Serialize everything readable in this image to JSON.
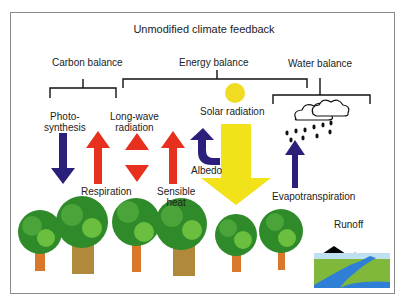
{
  "diagram": {
    "title": "Unmodified climate feedback",
    "groups": {
      "carbon": "Carbon balance",
      "energy": "Energy balance",
      "water": "Water balance"
    },
    "labels": {
      "photosynthesis_1": "Photo-",
      "photosynthesis_2": "synthesis",
      "longwave_1": "Long-wave",
      "longwave_2": "radiation",
      "respiration": "Respiration",
      "sensible_1": "Sensible",
      "sensible_2": "heat",
      "solar": "Solar radiation",
      "albedo": "Albedo",
      "evapotranspiration": "Evapotranspiration",
      "runoff": "Runoff"
    },
    "colors": {
      "blue_arrow": "#2a1f7a",
      "red_arrow": "#e8301e",
      "yellow": "#f2e21a",
      "tree_green": "#2f8a2a",
      "trunk": "#d9772a"
    }
  }
}
